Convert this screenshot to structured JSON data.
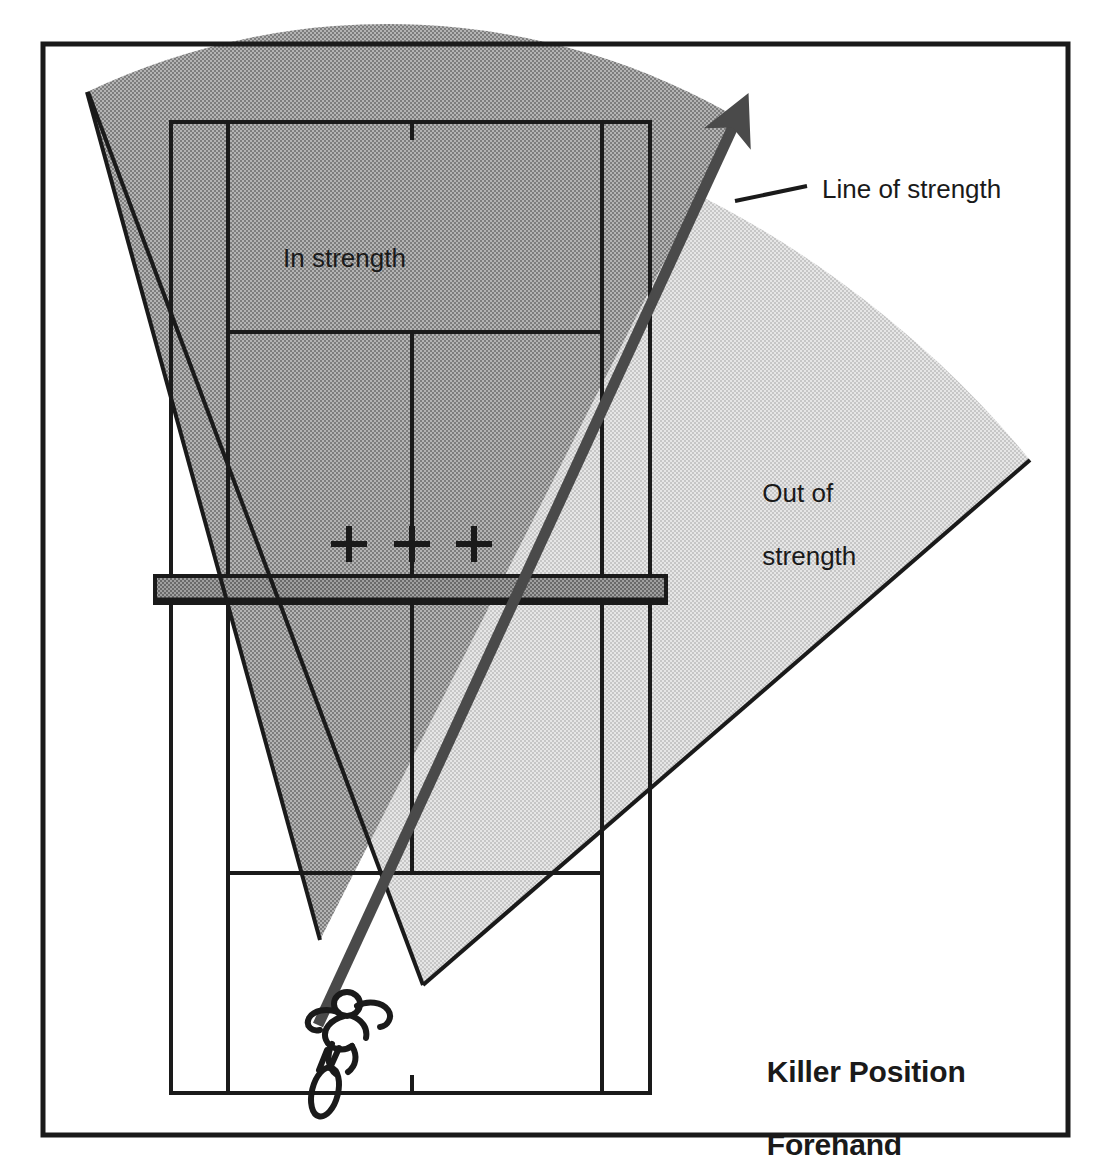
{
  "diagram": {
    "kind": "tennis-court-tactical-diagram",
    "title_line_1": "Killer Position",
    "title_line_2": "Forehand",
    "labels": {
      "in_strength": "In strength",
      "out_of_strength_line_1": "Out of",
      "out_of_strength_line_2": "strength",
      "line_of_strength": "Line of strength"
    },
    "colors": {
      "ink": "#1a1a1a",
      "court_line": "#1a1a1a",
      "in_strength_fill": "#9e9e9e",
      "out_of_strength_fill": "#d5d5d5",
      "net_fill": "#8f8f8f",
      "arrow": "#4a4a4a",
      "background": "#ffffff"
    },
    "frame": {
      "x": 43,
      "y": 44,
      "width": 1025,
      "height": 1091,
      "stroke_width": 5
    },
    "court": {
      "far_baseline_y": 122,
      "near_baseline_y": 1093,
      "doubles_left_x": 171,
      "doubles_right_x": 650,
      "singles_left_x": 228,
      "singles_right_x": 602,
      "far_service_line_y": 332,
      "near_service_line_y": 873,
      "center_service_line_x": 412,
      "net_top_y": 576,
      "net_bottom_y": 603,
      "net_left_x": 155,
      "net_right_x": 666,
      "center_marks": [
        {
          "x": 412,
          "y": 122
        },
        {
          "x": 412,
          "y": 1093
        }
      ]
    },
    "targets": {
      "name": "bounce-target-crosses",
      "size": 36,
      "points": [
        {
          "x": 349,
          "y": 544
        },
        {
          "x": 412,
          "y": 544
        },
        {
          "x": 474,
          "y": 544
        }
      ]
    },
    "in_strength_region": {
      "apex": {
        "x": 320,
        "y": 940
      },
      "left_corner": {
        "x": 87,
        "y": 92
      },
      "arc_end": {
        "x": 560,
        "y": 140
      }
    },
    "out_of_strength_region": {
      "apex": {
        "x": 423,
        "y": 985
      },
      "arc_far": {
        "x": 1030,
        "y": 460
      }
    },
    "line_of_strength_arrow": {
      "from": {
        "x": 318,
        "y": 1025
      },
      "to": {
        "x": 740,
        "y": 112
      },
      "stroke_width": 11
    },
    "leader_line": {
      "from": {
        "x": 735,
        "y": 200
      },
      "to": {
        "x": 805,
        "y": 185
      }
    },
    "player": {
      "name": "player-figure-with-racket",
      "x": 330,
      "y": 1022
    }
  }
}
